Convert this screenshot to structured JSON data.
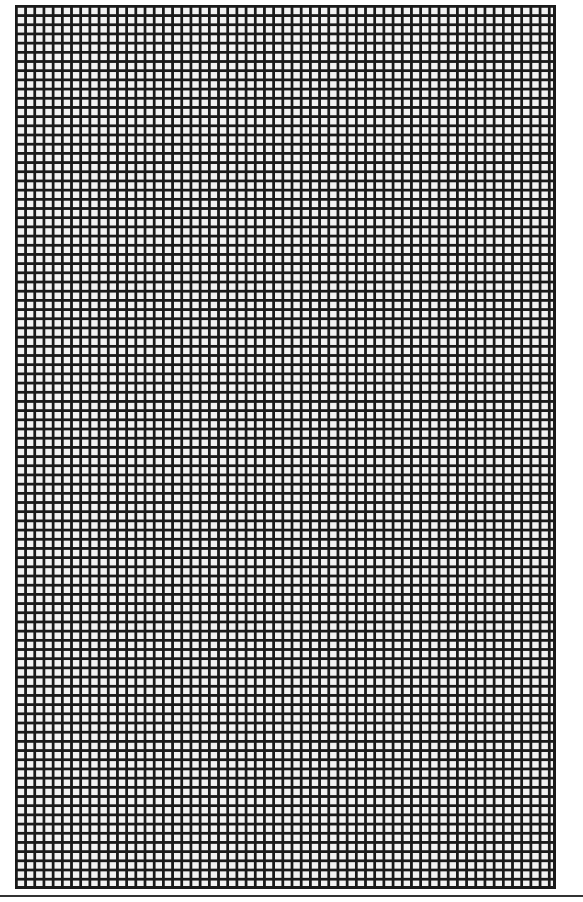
{
  "pattern": {
    "type": "square-grid",
    "line_color": "#1a1a1a",
    "cell_color": "#f2f2f2",
    "columns": 59,
    "rows": 96
  },
  "rule": {
    "color": "#333333"
  }
}
